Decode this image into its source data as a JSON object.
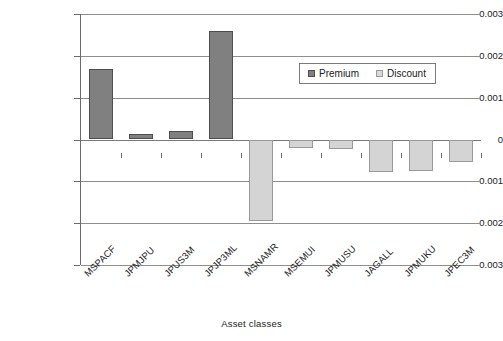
{
  "chart_data": {
    "type": "bar",
    "title": "",
    "xlabel": "Asset classes",
    "ylabel": "Liquidity",
    "categories": [
      "MSPACF",
      "JPMJPU",
      "JPUS3M",
      "JPJP3ML",
      "MSNAMR",
      "MSEMUI",
      "JPMUSU",
      "JAGALL",
      "JPMUKU",
      "JPEC3M"
    ],
    "values": [
      0.00168,
      0.00013,
      0.00021,
      0.0026,
      -0.00194,
      -0.00021,
      -0.00022,
      -0.00077,
      -0.00076,
      -0.00053
    ],
    "series": [
      {
        "name": "Premium",
        "color": "#808080",
        "values": [
          0.00168,
          0.00013,
          0.00021,
          0.0026,
          null,
          null,
          null,
          null,
          null,
          null
        ]
      },
      {
        "name": "Discount",
        "color": "#d4d4d4",
        "values": [
          null,
          null,
          null,
          null,
          -0.00194,
          -0.00021,
          -0.00022,
          -0.00077,
          -0.00076,
          -0.00053
        ]
      }
    ],
    "ylim": [
      -0.003,
      0.003
    ],
    "yticks": [
      0.003,
      0.002,
      0.001,
      0,
      -0.001,
      -0.002,
      -0.003
    ],
    "ytick_labels": [
      "0.003",
      "0.002",
      "0.001",
      "0",
      "-0.001",
      "-0.002",
      "-0.003"
    ],
    "grid": true,
    "legend_position": "upper-right-inset"
  },
  "axis": {
    "y_title": "Liquidity",
    "x_title": "Asset classes"
  },
  "legend": {
    "entries": [
      {
        "label": "Premium",
        "color": "#808080"
      },
      {
        "label": "Discount",
        "color": "#d9d9d9"
      }
    ]
  }
}
